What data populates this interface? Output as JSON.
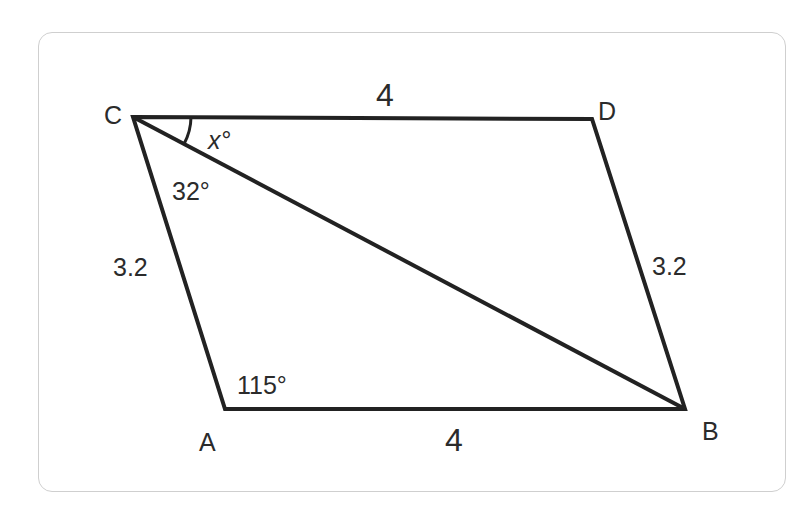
{
  "figure": {
    "type": "parallelogram",
    "vertices": {
      "C": {
        "label": "C",
        "x": 133,
        "y": 117
      },
      "D": {
        "label": "D",
        "x": 592,
        "y": 119
      },
      "B": {
        "label": "B",
        "x": 685,
        "y": 409
      },
      "A": {
        "label": "A",
        "x": 225,
        "y": 409
      }
    },
    "diagonal": [
      "C",
      "B"
    ],
    "side_labels": {
      "CD": "4",
      "AB": "4",
      "CA": "3.2",
      "DB": "3.2"
    },
    "angle_labels": {
      "DCB": "x°",
      "BCA": "32°",
      "CAB": "115°"
    },
    "stroke_color": "#222222",
    "text_color": "#2b2b2b",
    "border_color": "#cfcfcf"
  }
}
